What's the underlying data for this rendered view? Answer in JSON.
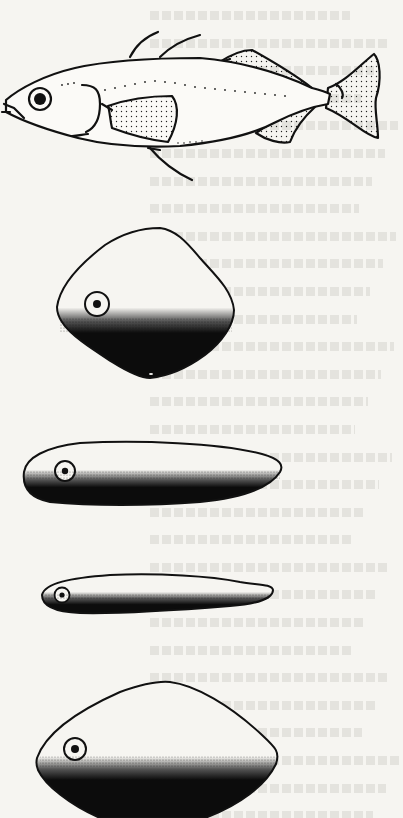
{
  "figure": {
    "colors": {
      "background": "#f6f5f1",
      "ink": "#111111",
      "bleed_through_text": "#d9d8d4"
    },
    "panels": [
      {
        "id": "fish-side-view",
        "label": "Fish, lateral view with stippled fins and lateral line",
        "bbox": [
          0,
          30,
          380,
          152
        ]
      },
      {
        "id": "cross-section-deep-diamond",
        "label": "Deep, rhomboid body cross-section",
        "bbox": [
          57,
          228,
          235,
          378
        ]
      },
      {
        "id": "cross-section-elongate",
        "label": "Elongate body shape",
        "bbox": [
          22,
          441,
          284,
          505
        ]
      },
      {
        "id": "cross-section-slender",
        "label": "Slender body shape",
        "bbox": [
          40,
          573,
          274,
          615
        ]
      },
      {
        "id": "cross-section-lenticular",
        "label": "Lenticular (oval) body shape",
        "bbox": [
          36,
          680,
          280,
          818
        ]
      }
    ]
  },
  "bleed_through": {
    "legible": false,
    "lines": 30
  }
}
